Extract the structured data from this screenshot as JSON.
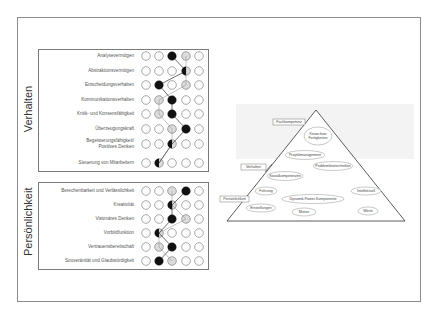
{
  "diagram": {
    "scale_points": 5,
    "colors": {
      "frame": "#8c8c8c",
      "box": "#7a7a7a",
      "profile_primary": "#111111",
      "profile_secondary": "#dcdcdc",
      "circle_outline": "#555555",
      "pyramid_line": "#333333",
      "pyramid_band": "#f2f2f2"
    }
  },
  "groups": [
    {
      "label": "Verhalten",
      "items": [
        {
          "label": "Analysevermögen",
          "primary": 3,
          "secondary": 4
        },
        {
          "label": "Abstraktionsvermögen",
          "primary": 4,
          "secondary": 4
        },
        {
          "label": "Entscheidungsverhalten",
          "primary": 2,
          "secondary": 4
        },
        {
          "label": "Kommunikationsverhalten",
          "primary": 3,
          "secondary": 2
        },
        {
          "label": "Kritik- und Konsensfähigkeit",
          "primary": 3,
          "secondary": 2
        },
        {
          "label": "Überzeugungskraft",
          "primary": 4,
          "secondary": 3
        },
        {
          "label": "Begeisterungsfähigkeit/ Positives Denken",
          "primary": 3,
          "secondary": 3
        },
        {
          "label": "Steuerung von Mitarbeitern",
          "primary": 2,
          "secondary": 2
        }
      ]
    },
    {
      "label": "Persönlichkeit",
      "items": [
        {
          "label": "Berechenbarkeit und Verlässlichkeit",
          "primary": 4,
          "secondary": 3
        },
        {
          "label": "Kreativität",
          "primary": 3,
          "secondary": 3
        },
        {
          "label": "Visionäres Denken",
          "primary": 3,
          "secondary": 4
        },
        {
          "label": "Vorbildfunktion",
          "primary": 2,
          "secondary": 2
        },
        {
          "label": "Vertrauensbereitschaft",
          "primary": 3,
          "secondary": 2
        },
        {
          "label": "Souveränität und Glaubwürdigkeit",
          "primary": 2,
          "secondary": 3
        }
      ]
    }
  ],
  "pyramid": {
    "layer_labels": [
      "Fachkompetenz",
      "Verhalten",
      "Persönlichkeit"
    ],
    "ellipses": [
      {
        "label": "Know-how Fertigkeiten",
        "layer": "Fachkompetenz"
      },
      {
        "label": "Projektmanagement",
        "layer": "Verhalten"
      },
      {
        "label": "Problemlösetechniken",
        "layer": "Verhalten"
      },
      {
        "label": "Sozialkompetenzen",
        "layer": "Verhalten"
      },
      {
        "label": "Führung",
        "layer": "Persönlichkeit"
      },
      {
        "label": "Intellektuell",
        "layer": "Persönlichkeit"
      },
      {
        "label": "Dynamik-Power-Komponente",
        "layer": "Persönlichkeit"
      },
      {
        "label": "Einstellungen",
        "layer": "Persönlichkeit"
      },
      {
        "label": "Motive",
        "layer": "Persönlichkeit"
      },
      {
        "label": "Werte",
        "layer": "Persönlichkeit"
      }
    ]
  }
}
